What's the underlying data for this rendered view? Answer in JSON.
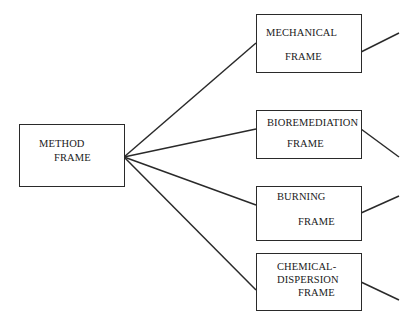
{
  "diagram": {
    "root": {
      "line1": "METHOD",
      "line2": "FRAME"
    },
    "children": [
      {
        "id": "mechanical",
        "line1": "MECHANICAL",
        "line2": "FRAME"
      },
      {
        "id": "bioremediation",
        "line1": "BIOREMEDIATION",
        "line2": "FRAME"
      },
      {
        "id": "burning",
        "line1": "BURNING",
        "line2": "FRAME"
      },
      {
        "id": "chemical-dispersion",
        "line1": "CHEMICAL-",
        "line2": "DISPERSION",
        "line3": "FRAME"
      }
    ],
    "colors": {
      "stroke": "#2a2a2a",
      "text": "#1a1a1a",
      "background": "#ffffff"
    }
  }
}
